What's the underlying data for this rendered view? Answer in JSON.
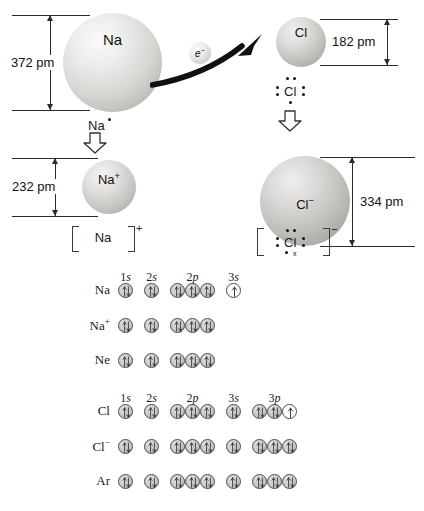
{
  "figure": {
    "atoms": {
      "sodium_atom": {
        "symbol": "Na",
        "diameter_label": "372 pm",
        "lewis_label": "Na",
        "lewis_dots": 1
      },
      "chlorine_atom": {
        "symbol": "Cl",
        "diameter_label": "182 pm",
        "lewis_label": "Cl",
        "lewis_dots": 7
      },
      "sodium_ion": {
        "symbol": "Na+",
        "symbol_base": "Na",
        "symbol_charge": "+",
        "diameter_label": "232 pm",
        "bracket_label": "Na",
        "bracket_charge": "+"
      },
      "chloride_ion": {
        "symbol": "Cl-",
        "symbol_base": "Cl",
        "symbol_charge": "−",
        "diameter_label": "334 pm",
        "bracket_label": "Cl",
        "bracket_charge": "−",
        "transferred_electron_mark": "x"
      }
    },
    "electron_transfer": {
      "label": "e",
      "charge": "−",
      "icon": "curved-arrow-icon"
    },
    "colors": {
      "sphere_light": "#f2f2f2",
      "sphere_mid": "#cfcfcf",
      "sphere_dark": "#9a9a9a",
      "orbital_fill": "#c9c9c9",
      "line": "#2b2b2b",
      "text": "#111111"
    }
  },
  "orbital_diagrams": {
    "group_na": {
      "subshells": [
        {
          "label_n": "1",
          "label_l": "s",
          "count": 1
        },
        {
          "label_n": "2",
          "label_l": "s",
          "count": 1
        },
        {
          "label_n": "2",
          "label_l": "p",
          "count": 3
        },
        {
          "label_n": "3",
          "label_l": "s",
          "count": 1
        }
      ],
      "rows": [
        {
          "label": "Na",
          "label_base": "Na",
          "label_charge": "",
          "orbitals": [
            "pair",
            "pair",
            "pair",
            "pair",
            "pair",
            "single"
          ]
        },
        {
          "label": "Na+",
          "label_base": "Na",
          "label_charge": "+",
          "orbitals": [
            "pair",
            "pair",
            "pair",
            "pair",
            "pair"
          ]
        },
        {
          "label": "Ne",
          "label_base": "Ne",
          "label_charge": "",
          "orbitals": [
            "pair",
            "pair",
            "pair",
            "pair",
            "pair"
          ]
        }
      ]
    },
    "group_cl": {
      "subshells": [
        {
          "label_n": "1",
          "label_l": "s",
          "count": 1
        },
        {
          "label_n": "2",
          "label_l": "s",
          "count": 1
        },
        {
          "label_n": "2",
          "label_l": "p",
          "count": 3
        },
        {
          "label_n": "3",
          "label_l": "s",
          "count": 1
        },
        {
          "label_n": "3",
          "label_l": "p",
          "count": 3
        }
      ],
      "rows": [
        {
          "label": "Cl",
          "label_base": "Cl",
          "label_charge": "",
          "orbitals": [
            "pair",
            "pair",
            "pair",
            "pair",
            "pair",
            "pair",
            "pair",
            "pair",
            "single"
          ]
        },
        {
          "label": "Cl-",
          "label_base": "Cl",
          "label_charge": "−",
          "orbitals": [
            "pair",
            "pair",
            "pair",
            "pair",
            "pair",
            "pair",
            "pair",
            "pair",
            "pair"
          ]
        },
        {
          "label": "Ar",
          "label_base": "Ar",
          "label_charge": "",
          "orbitals": [
            "pair",
            "pair",
            "pair",
            "pair",
            "pair",
            "pair",
            "pair",
            "pair",
            "pair"
          ]
        }
      ]
    }
  }
}
